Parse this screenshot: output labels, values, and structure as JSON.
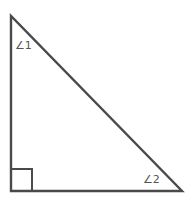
{
  "diagram": {
    "type": "right-triangle",
    "stroke_color": "#4a4a4a",
    "vertices": {
      "top": [
        11,
        16
      ],
      "bottom_left": [
        11,
        191
      ],
      "bottom_right": [
        182,
        191
      ]
    },
    "right_angle_marker": {
      "x": 11,
      "y": 169,
      "size": 21
    },
    "angle_labels": [
      {
        "id": "angle1",
        "text": "∠1",
        "x": 15,
        "y": 49
      },
      {
        "id": "angle2",
        "text": "∠2",
        "x": 143,
        "y": 183
      }
    ]
  }
}
